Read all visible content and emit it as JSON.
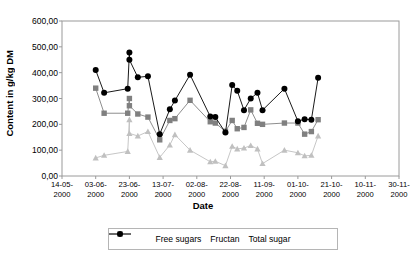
{
  "chart_data": {
    "type": "line",
    "title": "",
    "xlabel": "Date",
    "ylabel": "Content in g/kg DM",
    "ylim": [
      0,
      600
    ],
    "ytick_labels": [
      "0,00",
      "100,00",
      "200,00",
      "300,00",
      "400,00",
      "500,00",
      "600,00"
    ],
    "ytick_values": [
      0,
      100,
      200,
      300,
      400,
      500,
      600
    ],
    "xtick_labels": [
      "14-05-\n2000",
      "03-06-\n2000",
      "23-06-\n2000",
      "13-07-\n2000",
      "02-08-\n2000",
      "22-08-\n2000",
      "11-09-\n2000",
      "01-10-\n2000",
      "21-10-\n2000",
      "10-11-\n2000",
      "30-11-\n2000"
    ],
    "xticks_line1": [
      "14-05-",
      "03-06-",
      "23-06-",
      "13-07-",
      "02-08-",
      "22-08-",
      "11-09-",
      "01-10-",
      "21-10-",
      "10-11-",
      "30-11-"
    ],
    "xticks_line2": [
      "2000",
      "2000",
      "2000",
      "2000",
      "2000",
      "2000",
      "2000",
      "2000",
      "2000",
      "2000",
      "2000"
    ],
    "xlim_days": [
      0,
      200
    ],
    "grid": false,
    "legend_position": "bottom",
    "series": [
      {
        "name": "Free sugars",
        "color": "#808080",
        "marker": "square",
        "points": [
          [
            20,
            340
          ],
          [
            25,
            243
          ],
          [
            39,
            243
          ],
          [
            40,
            300
          ],
          [
            40,
            272
          ],
          [
            45,
            240
          ],
          [
            51,
            228
          ],
          [
            58,
            140
          ],
          [
            64,
            215
          ],
          [
            67,
            222
          ],
          [
            76,
            293
          ],
          [
            88,
            210
          ],
          [
            91,
            205
          ],
          [
            97,
            173
          ],
          [
            101,
            215
          ],
          [
            104,
            183
          ],
          [
            108,
            188
          ],
          [
            112,
            256
          ],
          [
            116,
            204
          ],
          [
            119,
            200
          ],
          [
            132,
            205
          ],
          [
            140,
            205
          ],
          [
            144,
            162
          ],
          [
            148,
            172
          ],
          [
            152,
            218
          ]
        ]
      },
      {
        "name": "Fructan",
        "color": "#c0c0c0",
        "marker": "triangle",
        "points": [
          [
            20,
            70
          ],
          [
            25,
            80
          ],
          [
            39,
            95
          ],
          [
            40,
            218
          ],
          [
            40,
            165
          ],
          [
            45,
            155
          ],
          [
            51,
            172
          ],
          [
            58,
            72
          ],
          [
            64,
            120
          ],
          [
            67,
            160
          ],
          [
            76,
            100
          ],
          [
            88,
            55
          ],
          [
            91,
            57
          ],
          [
            97,
            40
          ],
          [
            101,
            115
          ],
          [
            104,
            105
          ],
          [
            108,
            108
          ],
          [
            112,
            118
          ],
          [
            116,
            105
          ],
          [
            119,
            48
          ],
          [
            132,
            100
          ],
          [
            140,
            90
          ],
          [
            144,
            78
          ],
          [
            148,
            80
          ],
          [
            152,
            155
          ]
        ]
      },
      {
        "name": "Total sugar",
        "color": "#000000",
        "marker": "circle",
        "points": [
          [
            20,
            410
          ],
          [
            25,
            322
          ],
          [
            39,
            338
          ],
          [
            40,
            478
          ],
          [
            40,
            450
          ],
          [
            45,
            382
          ],
          [
            51,
            386
          ],
          [
            58,
            162
          ],
          [
            64,
            258
          ],
          [
            67,
            292
          ],
          [
            76,
            392
          ],
          [
            88,
            230
          ],
          [
            91,
            228
          ],
          [
            97,
            168
          ],
          [
            101,
            352
          ],
          [
            104,
            330
          ],
          [
            108,
            255
          ],
          [
            112,
            300
          ],
          [
            116,
            322
          ],
          [
            119,
            255
          ],
          [
            132,
            338
          ],
          [
            140,
            212
          ],
          [
            144,
            220
          ],
          [
            148,
            218
          ],
          [
            152,
            380
          ]
        ]
      }
    ]
  }
}
